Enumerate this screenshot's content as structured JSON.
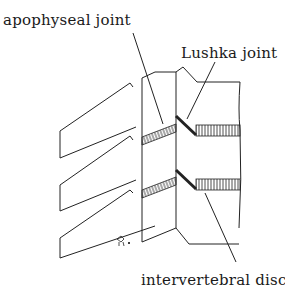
{
  "figure": {
    "labels": {
      "apophyseal_joint": "apophyseal joint",
      "lushka_joint": "Lushka joint",
      "intervertebral_disc": "intervertebral disc"
    },
    "colors": {
      "line": "#222222",
      "background": "#ffffff"
    }
  }
}
